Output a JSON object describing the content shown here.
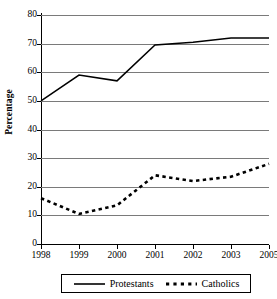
{
  "chart_data": {
    "type": "line",
    "title": "",
    "xlabel": "",
    "ylabel": "Percentage",
    "ylim": [
      0,
      80
    ],
    "ytick_values": [
      80,
      70,
      60,
      50,
      40,
      30,
      20,
      10,
      0
    ],
    "ytick_labels": [
      "80",
      "70",
      "60",
      "50",
      "40",
      "30",
      "20",
      "10",
      "0"
    ],
    "xtick_labels": [
      "1998",
      "1999",
      "2000",
      "2001",
      "2002",
      "2003",
      "2005"
    ],
    "x": [
      1998,
      1999,
      2000,
      2001,
      2002,
      2003,
      2005
    ],
    "grid": true,
    "legend_position": "bottom",
    "series": [
      {
        "name": "Protestants",
        "style": "solid",
        "color": "#000000",
        "values": [
          50,
          59,
          57,
          69.5,
          70.5,
          72,
          72
        ]
      },
      {
        "name": "Catholics",
        "style": "dashed",
        "color": "#000000",
        "values": [
          16,
          10.5,
          13.5,
          24,
          22,
          23.5,
          28
        ]
      }
    ]
  },
  "axis": {
    "y_title": "Percentage"
  },
  "legend": {
    "items": [
      {
        "label": "Protestants",
        "style": "solid"
      },
      {
        "label": "Catholics",
        "style": "dashed"
      }
    ]
  }
}
